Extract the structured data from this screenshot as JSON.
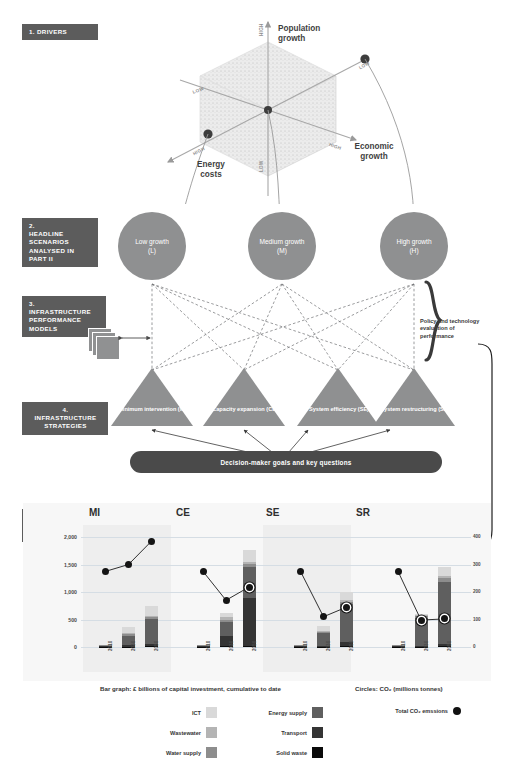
{
  "sections": [
    {
      "num": "1.",
      "text": "DRIVERS"
    },
    {
      "num": "2.",
      "text": "HEADLINE SCENARIOS ANALYSED IN PART II"
    },
    {
      "num": "3.",
      "text": "INFRASTRUCTURE PERFORMANCE MODELS"
    },
    {
      "num": "4.",
      "text": "INFRASTRUCTURE STRATEGIES"
    },
    {
      "num": "5.",
      "text": "PERFORMANCE EVALUATION"
    }
  ],
  "drivers": {
    "axes": [
      {
        "name": "Population growth",
        "high": "HIGH",
        "low": "LOW"
      },
      {
        "name": "Economic growth",
        "high": "HIGH",
        "low": "LOW"
      },
      {
        "name": "Energy costs",
        "high": "HIGH",
        "low": "LOW"
      }
    ],
    "population_label": "Population growth",
    "economic_label": "Economic growth",
    "energy_label": "Energy costs",
    "tick_high": "HIGH",
    "tick_low": "LOW"
  },
  "scenarios": [
    {
      "name": "Low growth",
      "code": "(L)"
    },
    {
      "name": "Medium growth",
      "code": "(M)"
    },
    {
      "name": "High growth",
      "code": "(H)"
    }
  ],
  "strategies": [
    {
      "label": "Minimum intervention (MI)",
      "code": "MI"
    },
    {
      "label": "Capacity expansion (CE)",
      "code": "CE"
    },
    {
      "label": "System efficiency (SE)",
      "code": "SE"
    },
    {
      "label": "System restructuring (SR)",
      "code": "SR"
    }
  ],
  "decision_bar": "Decision-maker goals and key questions",
  "policy_note": "Policy and technology evaluation of performance",
  "legend": {
    "bar_caption": "Bar graph: £ billions of capital investment, cumulative to date",
    "circle_caption": "Circles: CO₂ (millions tonnes)",
    "items": [
      {
        "label": "ICT",
        "color": "#d9d9d9"
      },
      {
        "label": "Wastewater",
        "color": "#b4b4b4"
      },
      {
        "label": "Water supply",
        "color": "#8d8d8d"
      },
      {
        "label": "Energy supply",
        "color": "#5f5f5f"
      },
      {
        "label": "Transport",
        "color": "#343434"
      },
      {
        "label": "Solid waste",
        "color": "#0a0a0a"
      }
    ],
    "total_co2": "Total CO₂ emssions"
  },
  "chart_data": {
    "type": "bar",
    "title": "Performance evaluation",
    "xlabel": "",
    "ylabel": "£ billions of capital investment, cumulative to date",
    "ylabel_right": "CO₂ (millions tonnes)",
    "ylim": [
      0,
      2000
    ],
    "ylim_right": [
      0,
      400
    ],
    "yticks": [
      "0",
      "500",
      "1,000",
      "1,500",
      "2,000"
    ],
    "yticks_right": [
      "0",
      "100",
      "200",
      "300",
      "400"
    ],
    "grid": true,
    "legend_position": "bottom",
    "categories": [
      "2010",
      "2030",
      "2050"
    ],
    "stack_order": [
      "Solid waste",
      "Transport",
      "Energy supply",
      "Water supply",
      "Wastewater",
      "ICT"
    ],
    "panels": [
      {
        "code": "MI",
        "series": [
          {
            "name": "Solid waste",
            "values": [
              2,
              8,
              15
            ]
          },
          {
            "name": "Transport",
            "values": [
              5,
              20,
              45
            ]
          },
          {
            "name": "Energy supply",
            "values": [
              8,
              170,
              450
            ]
          },
          {
            "name": "Water supply",
            "values": [
              2,
              40,
              35
            ]
          },
          {
            "name": "Wastewater",
            "values": [
              2,
              25,
              25
            ]
          },
          {
            "name": "ICT",
            "values": [
              3,
              105,
              175
            ]
          }
        ],
        "totals": [
          22,
          368,
          745
        ],
        "co2": [
          275,
          300,
          385
        ]
      },
      {
        "code": "CE",
        "series": [
          {
            "name": "Solid waste",
            "values": [
              2,
              10,
              20
            ]
          },
          {
            "name": "Transport",
            "values": [
              5,
              190,
              870
            ]
          },
          {
            "name": "Energy supply",
            "values": [
              8,
              260,
              560
            ]
          },
          {
            "name": "Water supply",
            "values": [
              2,
              40,
              60
            ]
          },
          {
            "name": "Wastewater",
            "values": [
              2,
              40,
              40
            ]
          },
          {
            "name": "ICT",
            "values": [
              3,
              80,
              210
            ]
          }
        ],
        "totals": [
          22,
          620,
          1760
        ],
        "co2": [
          275,
          170,
          218
        ]
      },
      {
        "code": "SE",
        "series": [
          {
            "name": "Solid waste",
            "values": [
              2,
              8,
              18
            ]
          },
          {
            "name": "Transport",
            "values": [
              5,
              15,
              70
            ]
          },
          {
            "name": "Energy supply",
            "values": [
              8,
              230,
              700
            ]
          },
          {
            "name": "Water supply",
            "values": [
              2,
              25,
              35
            ]
          },
          {
            "name": "Wastewater",
            "values": [
              2,
              20,
              30
            ]
          },
          {
            "name": "ICT",
            "values": [
              3,
              80,
              145
            ]
          }
        ],
        "totals": [
          22,
          378,
          998
        ],
        "co2": [
          275,
          110,
          145
        ]
      },
      {
        "code": "SR",
        "series": [
          {
            "name": "Solid waste",
            "values": [
              2,
              8,
              20
            ]
          },
          {
            "name": "Transport",
            "values": [
              5,
              12,
              40
            ]
          },
          {
            "name": "Energy supply",
            "values": [
              8,
              510,
              1130
            ]
          },
          {
            "name": "Water supply",
            "values": [
              2,
              25,
              60
            ]
          },
          {
            "name": "Wastewater",
            "values": [
              2,
              20,
              40
            ]
          },
          {
            "name": "ICT",
            "values": [
              3,
              30,
              170
            ]
          }
        ],
        "totals": [
          22,
          605,
          1460
        ],
        "co2": [
          275,
          98,
          102
        ]
      }
    ]
  }
}
